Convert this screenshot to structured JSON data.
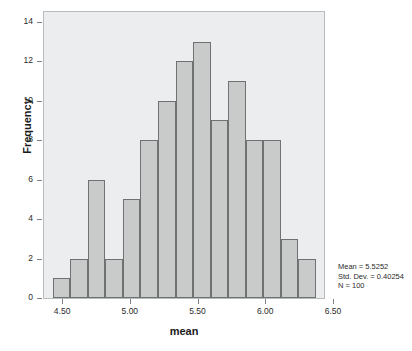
{
  "chart_data": {
    "type": "bar",
    "title": "",
    "subtitle": "",
    "xlabel": "mean",
    "ylabel": "Frequency",
    "xlim": [
      4.3587,
      6.4413
    ],
    "ylim": [
      0,
      14.6
    ],
    "grid": false,
    "legend": null,
    "bin_width": 0.1295,
    "bin_starts": [
      4.4236,
      4.5531,
      4.6826,
      4.8121,
      4.9416,
      5.0711,
      5.2006,
      5.3301,
      5.4596,
      5.5891,
      5.7186,
      5.8481,
      5.9776,
      6.1071,
      6.2366
    ],
    "categories": [
      "4.42-4.55",
      "4.55-4.68",
      "4.68-4.81",
      "4.81-4.94",
      "4.94-5.07",
      "5.07-5.20",
      "5.20-5.33",
      "5.33-5.46",
      "5.46-5.59",
      "5.59-5.72",
      "5.72-5.85",
      "5.85-5.98",
      "5.98-6.11",
      "6.11-6.24",
      "6.24-6.36"
    ],
    "values": [
      1,
      2,
      6,
      2,
      5,
      8,
      10,
      12,
      13,
      9,
      11,
      8,
      8,
      3,
      2
    ],
    "xticks": [
      4.5,
      5.0,
      5.5,
      6.0,
      6.5
    ],
    "xticklabels": [
      "4.50",
      "5.00",
      "5.50",
      "6.00",
      "6.50"
    ],
    "yticks": [
      0,
      2,
      4,
      6,
      8,
      10,
      12,
      14
    ],
    "yticklabels": [
      "0",
      "2",
      "4",
      "6",
      "8",
      "10",
      "12",
      "14"
    ],
    "annotations": {
      "mean_label": "Mean = 5.5252",
      "stddev_label": "Std. Dev. = 0.40254",
      "n_label": "N = 100"
    },
    "colors": {
      "bar_fill": "#c9cbcb",
      "bar_edge": "#6e7273",
      "plot_background": "#ecedee",
      "frame_border": "#b8bcbe",
      "text": "#2b2b2b",
      "page_background": "#ffffff"
    }
  }
}
